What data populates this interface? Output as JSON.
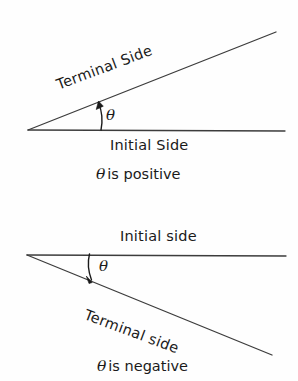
{
  "figure": {
    "width": 298,
    "height": 381,
    "background_color": "#fefefe",
    "line_color": "#3c3c3c",
    "text_color": "#1a1a1a"
  },
  "panels": [
    {
      "id": "positive",
      "caption_symbol": "θ",
      "caption_text": "is positive",
      "angle_symbol": "θ",
      "rays": {
        "initial": {
          "label": "Initial Side",
          "from": [
            28,
            130
          ],
          "to": [
            285,
            131
          ]
        },
        "terminal": {
          "label": "Terminal Side",
          "from": [
            28,
            130
          ],
          "to": [
            276,
            32
          ],
          "rotation_deg": -20.5
        }
      },
      "arc": {
        "direction": "counterclockwise",
        "arrow": "up",
        "from": [
          100,
          130
        ],
        "to": [
          98,
          102
        ]
      }
    },
    {
      "id": "negative",
      "caption_symbol": "θ",
      "caption_text": "is negative",
      "angle_symbol": "θ",
      "rays": {
        "initial": {
          "label": "Initial side",
          "from": [
            27,
            255
          ],
          "to": [
            286,
            256
          ]
        },
        "terminal": {
          "label": "Terminal side",
          "from": [
            27,
            255
          ],
          "to": [
            272,
            355
          ],
          "rotation_deg": 20.5
        }
      },
      "arc": {
        "direction": "clockwise",
        "arrow": "down",
        "from": [
          90,
          254
        ],
        "to": [
          92,
          282
        ]
      }
    }
  ]
}
